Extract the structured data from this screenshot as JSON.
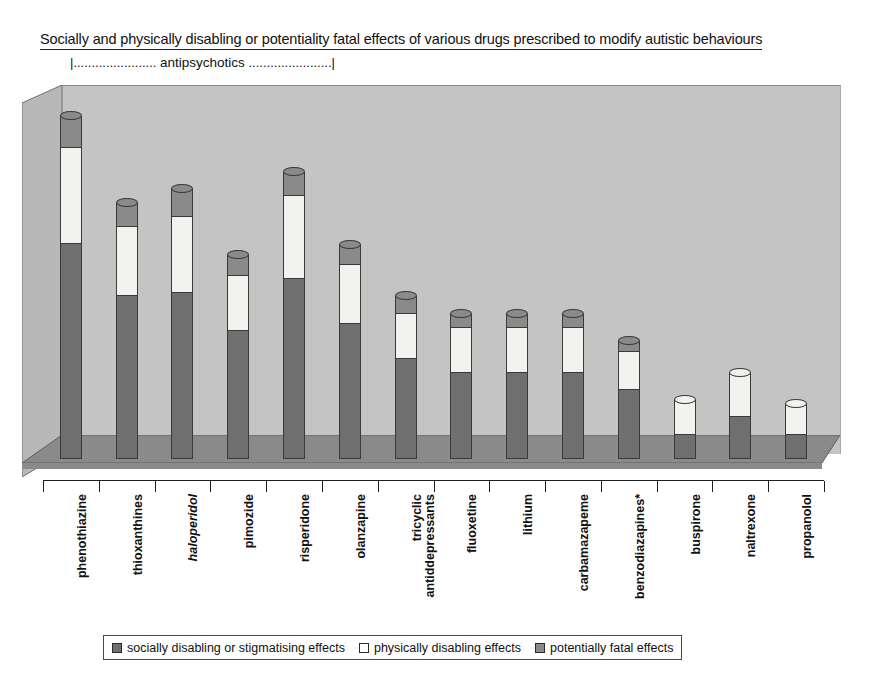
{
  "title": "Socially and physically disabling or potentiality fatal effects of various drugs prescribed to modify autistic behaviours",
  "group_bracket": {
    "left": "|.......................",
    "label": "antipsychotics",
    "right": ".......................|"
  },
  "legend": {
    "items": [
      {
        "swatch": "social",
        "label": "socially disabling or stigmatising effects"
      },
      {
        "swatch": "physical",
        "label": "physically  disabling effects"
      },
      {
        "swatch": "fatal",
        "label": "potentially  fatal effects"
      }
    ]
  },
  "colors": {
    "social": "#6f6f6f",
    "physical": "#f2f2ef",
    "fatal": "#8a8a8a",
    "back_wall": "#c4c4c4",
    "floor": "#8a8a8a",
    "left_wall": "#b4b4b4",
    "outline": "#3a3a3a"
  },
  "chart_data": {
    "type": "bar",
    "subtype": "stacked-3d-cylinder",
    "title": "Socially and physically disabling or potentiality fatal effects of various drugs prescribed to modify autistic behaviours",
    "xlabel": "",
    "ylabel": "",
    "grid": false,
    "axis_ticks_labelled": false,
    "ylim": [
      0,
      100
    ],
    "legend_position": "bottom",
    "annotations": [
      "antipsychotics bracket spans phenothiazine through olanzapine",
      "* on benzodiazapines"
    ],
    "categories": [
      "phenothiazine",
      "thioxanthines",
      "haloperidol",
      "pimozide",
      "risperidone",
      "olanzapine",
      "tricyclic antidepressants",
      "fluoxetine",
      "lithium",
      "carbamazapeme",
      "benzodiazapines*",
      "buspirone",
      "naltrexone",
      "propanolol"
    ],
    "category_italic": [
      false,
      false,
      true,
      false,
      false,
      false,
      false,
      false,
      false,
      false,
      false,
      false,
      false,
      false
    ],
    "category_lines": [
      [
        "phenothiazine"
      ],
      [
        "thioxanthines"
      ],
      [
        "haloperidol"
      ],
      [
        "pimozide"
      ],
      [
        "risperidone"
      ],
      [
        "olanzapine"
      ],
      [
        "tricyclic",
        "antiddepressants"
      ],
      [
        "fluoxetine"
      ],
      [
        "lithium"
      ],
      [
        "carbamazapeme"
      ],
      [
        "benzodiazapines*"
      ],
      [
        "buspirone"
      ],
      [
        "naltrexone"
      ],
      [
        "propanolol"
      ]
    ],
    "series": [
      {
        "name": "socially disabling or stigmatising effects",
        "color": "#6f6f6f",
        "values": [
          62,
          47,
          48,
          37,
          52,
          39,
          29,
          25,
          25,
          25,
          20,
          7,
          12,
          7
        ]
      },
      {
        "name": "physically  disabling effects",
        "color": "#f2f2ef",
        "values": [
          28,
          20,
          22,
          16,
          24,
          17,
          13,
          13,
          13,
          13,
          11,
          10,
          13,
          9
        ]
      },
      {
        "name": "potentially  fatal effects",
        "color": "#8a8a8a",
        "values": [
          9,
          7,
          8,
          6,
          7,
          6,
          5,
          4,
          4,
          4,
          3,
          0,
          0,
          0
        ]
      }
    ],
    "totals": [
      99,
      74,
      78,
      59,
      83,
      62,
      47,
      42,
      42,
      42,
      34,
      17,
      25,
      16
    ]
  }
}
